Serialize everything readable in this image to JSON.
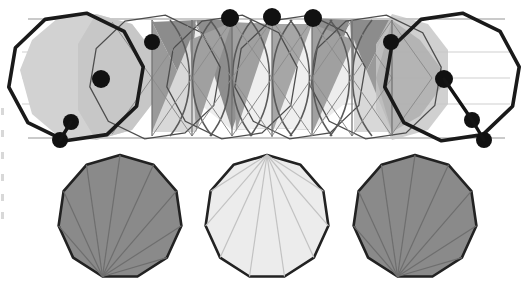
{
  "figure": {
    "canvas": {
      "width": 531,
      "height": 293,
      "background": "#ffffff"
    },
    "palette": {
      "outline_dark": "#1a1a1a",
      "outline_mid": "#4d4d4d",
      "outline_light": "#b3b3b3",
      "fill_white": "#ffffff",
      "fill_very_light": "#ececec",
      "fill_light": "#d6d6d6",
      "fill_mid_light": "#c0c0c0",
      "fill_mid": "#9a9a9a",
      "fill_dark": "#848484",
      "vertex_dot": "#111111"
    },
    "top_figure": {
      "name": "antiprism-band-projection",
      "description": "Elongated band of interpenetrating decagonal cells seen in parallel projection",
      "band": {
        "left": 20,
        "right": 512,
        "top": 14,
        "bottom": 140
      },
      "thick_outline_cells": [
        {
          "cx": 76,
          "cy": 77,
          "r": 68,
          "rotation": 9
        },
        {
          "cx": 452,
          "cy": 77,
          "r": 68,
          "rotation": 9
        }
      ],
      "thin_outline_cells": [
        {
          "cx": 155,
          "cy": 77,
          "r": 66,
          "rotation": 9
        },
        {
          "cx": 232,
          "cy": 77,
          "r": 66,
          "rotation": 9
        },
        {
          "cx": 300,
          "cy": 77,
          "r": 66,
          "rotation": 9
        },
        {
          "cx": 376,
          "cy": 77,
          "r": 66,
          "rotation": 9
        }
      ],
      "vertex_dots": [
        {
          "id": "v1",
          "x": 60,
          "y": 140,
          "r": 8
        },
        {
          "id": "v2",
          "x": 71,
          "y": 122,
          "r": 8
        },
        {
          "id": "v3",
          "x": 101,
          "y": 79,
          "r": 9
        },
        {
          "id": "v4",
          "x": 152,
          "y": 42,
          "r": 8
        },
        {
          "id": "v5",
          "x": 230,
          "y": 18,
          "r": 9
        },
        {
          "id": "v6",
          "x": 272,
          "y": 17,
          "r": 9
        },
        {
          "id": "v7",
          "x": 313,
          "y": 18,
          "r": 9
        },
        {
          "id": "v8",
          "x": 391,
          "y": 42,
          "r": 8
        },
        {
          "id": "v9",
          "x": 444,
          "y": 79,
          "r": 9
        },
        {
          "id": "v10",
          "x": 472,
          "y": 120,
          "r": 8
        },
        {
          "id": "v11",
          "x": 484,
          "y": 140,
          "r": 8
        }
      ],
      "vertex_dot_count": 11
    },
    "bottom_row": {
      "name": "decagon-face-row",
      "polygon_sides": 11,
      "polygons": [
        {
          "id": "face-left",
          "label": "dark shaded hendecagon, fan from bottom vertex",
          "cx": 120,
          "cy": 217,
          "r": 62,
          "rotation": 0,
          "fill": "#8a8a8a",
          "stroke": "#222222",
          "fan_apex": "bottom",
          "fan_stroke": "#6e6e6e"
        },
        {
          "id": "face-middle",
          "label": "light shaded hendecagon, fan from top vertex",
          "cx": 267,
          "cy": 217,
          "r": 62,
          "rotation": 0,
          "fill": "#ececec",
          "stroke": "#222222",
          "fan_apex": "top",
          "fan_stroke": "#c2c2c2"
        },
        {
          "id": "face-right",
          "label": "dark shaded hendecagon, fan from bottom vertex",
          "cx": 415,
          "cy": 217,
          "r": 62,
          "rotation": 0,
          "fill": "#8a8a8a",
          "stroke": "#222222",
          "fan_apex": "bottom",
          "fan_stroke": "#6e6e6e"
        }
      ]
    },
    "scan_artifacts": {
      "name": "left-edge-scan-marks",
      "count": 6,
      "marks_y": [
        0,
        22,
        44,
        66,
        86,
        104
      ]
    }
  }
}
